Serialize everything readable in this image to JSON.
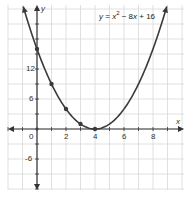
{
  "chart_data": {
    "type": "line",
    "title": "",
    "equation": "y = x^2 - 8x + 16",
    "equation_parts": {
      "y": "y",
      "eq": " = ",
      "x1": "x",
      "sup": "2",
      "mid": " − 8",
      "x2": "x",
      "end": " + 16"
    },
    "xlabel": "x",
    "ylabel": "y",
    "x_ticks": [
      "0",
      "2",
      "4",
      "6",
      "8"
    ],
    "y_ticks": [
      "12",
      "6",
      "-6"
    ],
    "xlim": [
      -2.5,
      9.8
    ],
    "ylim": [
      -12,
      24
    ],
    "grid": true,
    "series": [
      {
        "name": "y = x^2 - 8x + 16",
        "function": "x^2-8x+16",
        "points": [
          {
            "x": 0,
            "y": 16
          },
          {
            "x": 1,
            "y": 9
          },
          {
            "x": 2,
            "y": 4
          },
          {
            "x": 3,
            "y": 1
          },
          {
            "x": 4,
            "y": 0
          }
        ]
      }
    ],
    "colors": {
      "curve": "#3a3a3a",
      "grid": "#d8d8d8",
      "axis": "#333333",
      "point": "#3a3a3a"
    }
  }
}
